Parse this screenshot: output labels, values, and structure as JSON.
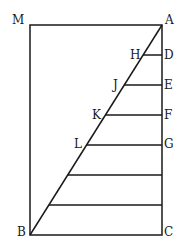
{
  "diagram": {
    "labels": {
      "M": "M",
      "A": "A",
      "H": "H",
      "D": "D",
      "J": "J",
      "E": "E",
      "K": "K",
      "F": "F",
      "L": "L",
      "G": "G",
      "B": "B",
      "C": "C"
    },
    "rectangle": {
      "corners": [
        "M",
        "A",
        "C",
        "B"
      ]
    },
    "diagonal": {
      "from": "A",
      "to": "B"
    },
    "horizontal_segments": [
      {
        "left": "H",
        "right": "D"
      },
      {
        "left": "J",
        "right": "E"
      },
      {
        "left": "K",
        "right": "F"
      },
      {
        "left": "L",
        "right": "G"
      },
      {
        "left": "",
        "right": ""
      },
      {
        "left": "",
        "right": ""
      }
    ],
    "colors": {
      "line": "#1a1a1a",
      "background": "#ffffff"
    }
  }
}
